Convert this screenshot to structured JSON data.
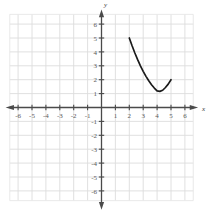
{
  "chart_data": {
    "type": "line",
    "title": "",
    "xlabel": "x",
    "ylabel": "y",
    "xlim": [
      -7,
      7
    ],
    "ylim": [
      -7,
      7
    ],
    "grid": true,
    "legend": "none",
    "xticks": [
      -6,
      -5,
      -4,
      -3,
      -2,
      -1,
      1,
      2,
      3,
      4,
      5,
      6
    ],
    "yticks": [
      -6,
      -5,
      -4,
      -3,
      -2,
      -1,
      1,
      2,
      3,
      4,
      5,
      6
    ],
    "xtick_labels": [
      "-6",
      "-5",
      "-4",
      "-3",
      "-2",
      "-1",
      "1",
      "2",
      "3",
      "4",
      "5",
      "6"
    ],
    "ytick_labels": [
      "-6",
      "-5",
      "-4",
      "-3",
      "-2",
      "-1",
      "1",
      "2",
      "3",
      "4",
      "5",
      "6"
    ],
    "series": [
      {
        "name": "curve",
        "color": "#1a1a1a",
        "x": [
          2.0,
          2.2,
          2.4,
          2.6,
          2.8,
          3.0,
          3.2,
          3.4,
          3.6,
          3.8,
          4.0,
          4.2,
          4.4,
          4.6,
          4.8,
          5.0
        ],
        "y": [
          5.0,
          4.44,
          3.92,
          3.44,
          3.0,
          2.6,
          2.24,
          1.92,
          1.64,
          1.4,
          1.2,
          1.16,
          1.24,
          1.44,
          1.68,
          2.0
        ],
        "endpoints": [
          [
            2,
            5
          ],
          [
            5,
            2
          ]
        ],
        "vertex": [
          4.1,
          1.15
        ]
      }
    ],
    "annotations": []
  },
  "axis_labels": {
    "x": "x",
    "y": "y"
  }
}
